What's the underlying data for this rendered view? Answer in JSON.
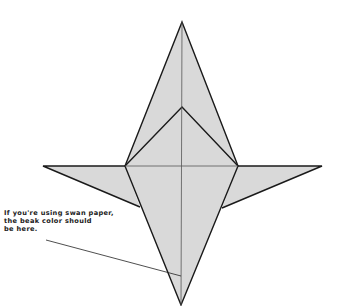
{
  "diagram": {
    "annotation": "If you're using swan paper,\nthe beak color should\nbe here.",
    "colors": {
      "paper": "#d9d9d9",
      "outline": "#1a1a1a",
      "background": "#ffffff"
    }
  }
}
